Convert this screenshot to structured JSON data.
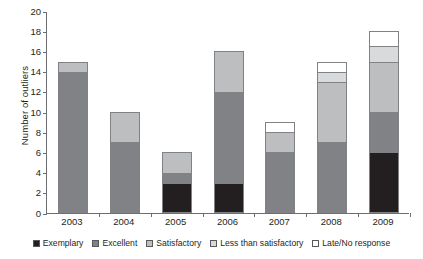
{
  "chart_data": {
    "type": "bar",
    "stacked": true,
    "title": "",
    "xlabel": "",
    "ylabel": "Number of outliers",
    "ylim": [
      0,
      20
    ],
    "ytick_step": 2,
    "yticks": [
      0,
      2,
      4,
      6,
      8,
      10,
      12,
      14,
      16,
      18,
      20
    ],
    "grid": false,
    "legend_position": "bottom",
    "categories": [
      "2003",
      "2004",
      "2005",
      "2006",
      "2007",
      "2008",
      "2009"
    ],
    "series": [
      {
        "name": "Exemplary",
        "color": "#231f20",
        "values": [
          0,
          0,
          3,
          3,
          0,
          0,
          6
        ]
      },
      {
        "name": "Excellent",
        "color": "#808285",
        "values": [
          14,
          7,
          1,
          9,
          6,
          7,
          4
        ]
      },
      {
        "name": "Satisfactory",
        "color": "#bcbec0",
        "values": [
          1,
          3,
          2,
          4,
          2,
          6,
          5
        ]
      },
      {
        "name": "Less than satisfactory",
        "color": "#d9dadb",
        "values": [
          0,
          0,
          0,
          0,
          0,
          1,
          1.5
        ]
      },
      {
        "name": "Late/No response",
        "color": "#ffffff",
        "values": [
          0,
          0,
          0,
          0,
          1,
          1,
          1.5
        ]
      }
    ],
    "totals": [
      15,
      10,
      6,
      16,
      9,
      15,
      18
    ]
  }
}
